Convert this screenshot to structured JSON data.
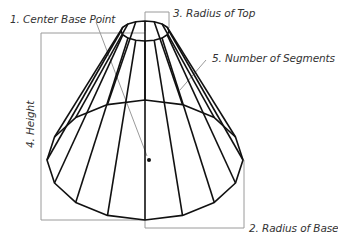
{
  "diagram": {
    "colors": {
      "edge": "#111111",
      "guide": "#9a9a9a",
      "text": "#333333",
      "background": "#ffffff"
    },
    "labels": {
      "center_base_point": "1. Center Base Point",
      "radius_of_base": "2. Radius of Base",
      "radius_of_top": "3. Radius of Top",
      "height": "4. Height",
      "number_of_segments": "5. Number of Segments"
    },
    "cone": {
      "segments": 16,
      "top_center": [
        145,
        31
      ],
      "top_radius_x": 24,
      "top_radius_y": 10,
      "base_center": [
        145,
        160
      ],
      "base_radius_x": 98,
      "base_radius_y": 60
    }
  }
}
